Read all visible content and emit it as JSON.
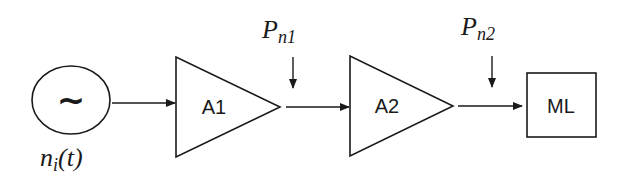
{
  "diagram": {
    "type": "block-diagram",
    "source": {
      "symbol": "~",
      "label_main": "n",
      "label_sub": "i",
      "label_arg": "(t)"
    },
    "blocks": [
      {
        "id": "A1",
        "shape": "triangle-amplifier",
        "label": "A1"
      },
      {
        "id": "A2",
        "shape": "triangle-amplifier",
        "label": "A2"
      },
      {
        "id": "ML",
        "shape": "rectangle",
        "label": "ML"
      }
    ],
    "injections": [
      {
        "label_main": "P",
        "label_sub": "n1",
        "between": [
          "A1",
          "A2"
        ]
      },
      {
        "label_main": "P",
        "label_sub": "n2",
        "between": [
          "A2",
          "ML"
        ]
      }
    ],
    "colors": {
      "stroke": "#1a1a1a",
      "background": "#ffffff"
    }
  }
}
